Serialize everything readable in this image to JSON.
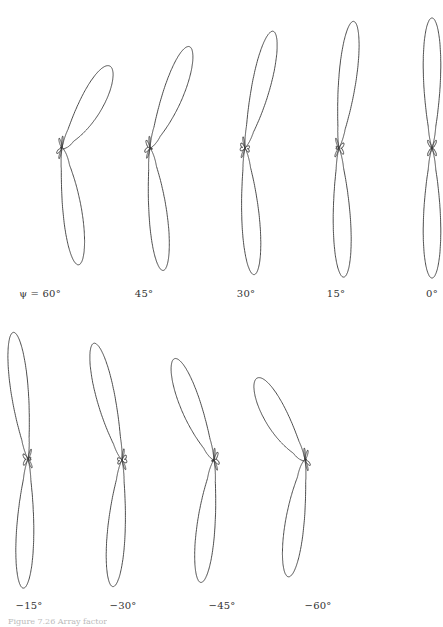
{
  "figure": {
    "stroke_color": "#3a3a3a",
    "background": "#ffffff",
    "caption": "Figure 7.26 Array factor"
  },
  "chart_data": {
    "type": "polar",
    "title": "",
    "parameter": "ψ",
    "patterns": [
      {
        "label": "ψ = 60°",
        "psi_deg": 60,
        "cx": 62,
        "cy": 148,
        "label_x": 40,
        "label_y": 288
      },
      {
        "label": "45°",
        "psi_deg": 45,
        "cx": 150,
        "cy": 148,
        "label_x": 144,
        "label_y": 288
      },
      {
        "label": "30°",
        "psi_deg": 30,
        "cx": 245,
        "cy": 148,
        "label_x": 246,
        "label_y": 288
      },
      {
        "label": "15°",
        "psi_deg": 15,
        "cx": 339,
        "cy": 148,
        "label_x": 336,
        "label_y": 288
      },
      {
        "label": "0°",
        "psi_deg": 0,
        "cx": 432,
        "cy": 148,
        "label_x": 432,
        "label_y": 288
      },
      {
        "label": "−15°",
        "psi_deg": -15,
        "cx": 28,
        "cy": 459,
        "label_x": 29,
        "label_y": 600
      },
      {
        "label": "−30°",
        "psi_deg": -30,
        "cx": 122,
        "cy": 460,
        "label_x": 123,
        "label_y": 600
      },
      {
        "label": "−45°",
        "psi_deg": -45,
        "cx": 214,
        "cy": 460,
        "label_x": 222,
        "label_y": 600
      },
      {
        "label": "−60°",
        "psi_deg": -60,
        "cx": 305,
        "cy": 460,
        "label_x": 318,
        "label_y": 600
      }
    ],
    "main_lobe_length_px": 130,
    "side_lobe_length_px": 22
  }
}
